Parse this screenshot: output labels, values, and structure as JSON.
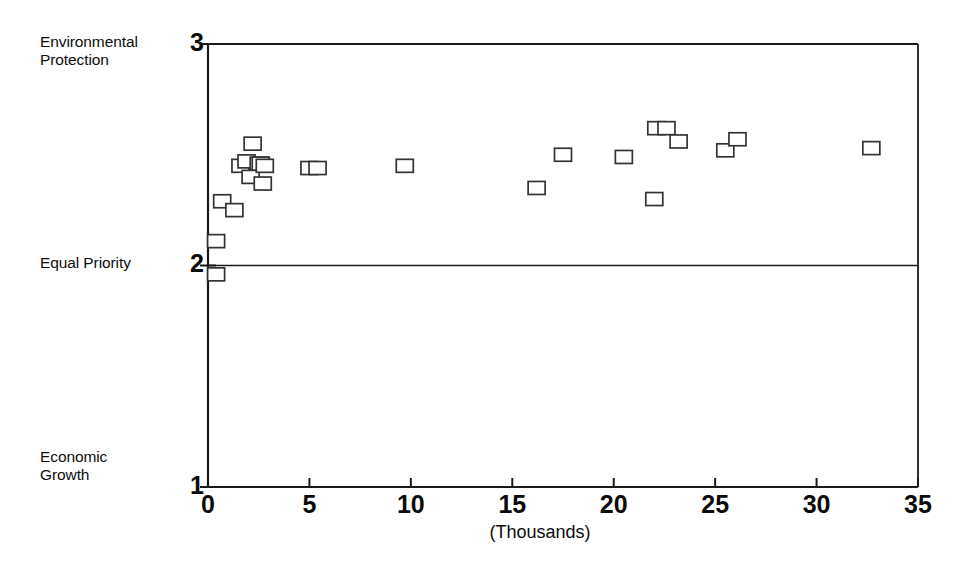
{
  "chart_data": {
    "type": "scatter",
    "title": "",
    "subtitle": "",
    "xlabel": "(Thousands)",
    "ylabel": "",
    "xlim": [
      0,
      35
    ],
    "ylim": [
      1,
      3
    ],
    "grid": false,
    "legend": null,
    "x_ticks": [
      0,
      5,
      10,
      15,
      20,
      25,
      30,
      35
    ],
    "x_tick_labels": [
      "0",
      "5",
      "10",
      "15",
      "20",
      "25",
      "30",
      "35"
    ],
    "y_ticks": [
      1,
      2,
      3
    ],
    "y_tick_labels": [
      "1",
      "2",
      "3"
    ],
    "y_category_labels": [
      {
        "value": 3,
        "label": "Environmental\nProtection"
      },
      {
        "value": 2,
        "label": "Equal Priority"
      },
      {
        "value": 1,
        "label": "Economic\nGrowth"
      }
    ],
    "reference_lines": [
      {
        "axis": "y",
        "value": 2,
        "label": "Equal Priority"
      }
    ],
    "marker": "open-square",
    "series": [
      {
        "name": "countries",
        "points": [
          {
            "x": 0.4,
            "y": 1.96
          },
          {
            "x": 0.4,
            "y": 2.11
          },
          {
            "x": 0.7,
            "y": 2.29
          },
          {
            "x": 1.3,
            "y": 2.25
          },
          {
            "x": 1.6,
            "y": 2.45
          },
          {
            "x": 1.9,
            "y": 2.47
          },
          {
            "x": 2.2,
            "y": 2.55
          },
          {
            "x": 2.1,
            "y": 2.4
          },
          {
            "x": 2.5,
            "y": 2.46
          },
          {
            "x": 2.6,
            "y": 2.46
          },
          {
            "x": 2.8,
            "y": 2.45
          },
          {
            "x": 2.7,
            "y": 2.37
          },
          {
            "x": 5.0,
            "y": 2.44
          },
          {
            "x": 5.4,
            "y": 2.44
          },
          {
            "x": 9.7,
            "y": 2.45
          },
          {
            "x": 16.2,
            "y": 2.35
          },
          {
            "x": 17.5,
            "y": 2.5
          },
          {
            "x": 20.5,
            "y": 2.49
          },
          {
            "x": 22.0,
            "y": 2.3
          },
          {
            "x": 22.1,
            "y": 2.62
          },
          {
            "x": 22.6,
            "y": 2.62
          },
          {
            "x": 23.2,
            "y": 2.56
          },
          {
            "x": 25.5,
            "y": 2.52
          },
          {
            "x": 26.1,
            "y": 2.57
          },
          {
            "x": 32.7,
            "y": 2.53
          }
        ]
      }
    ]
  },
  "axis": {
    "x_title": "(Thousands)"
  },
  "colors": {
    "axis": "#1a1a1a",
    "marker_stroke": "#333333",
    "marker_fill": "#ffffff",
    "reference_line": "#1a1a1a",
    "background": "#ffffff"
  }
}
